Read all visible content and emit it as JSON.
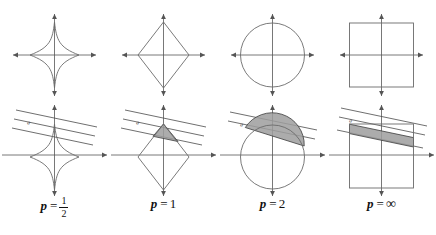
{
  "figure": {
    "rows": 2,
    "columns": 4,
    "colors": {
      "curve": "#6b6b6b",
      "axis": "#555555",
      "line": "#4a4a4a",
      "shade_fill": "#9e9e9e",
      "shade_stroke": "#3c3c3c",
      "text": "#111111",
      "background": "#ffffff"
    }
  },
  "panels": [
    {
      "id": "p-half",
      "p_value": "1/2",
      "shape": "astroid",
      "caption": {
        "variable": "p",
        "equals": "=",
        "numerator": "1",
        "denominator": "2"
      },
      "line_label": "a",
      "has_shading": false,
      "shade_shape": "none"
    },
    {
      "id": "p-one",
      "p_value": "1",
      "shape": "diamond",
      "caption": {
        "variable": "p",
        "equals": "=",
        "value": "1"
      },
      "line_label": "a",
      "has_shading": true,
      "shade_shape": "triangle-cap"
    },
    {
      "id": "p-two",
      "p_value": "2",
      "shape": "circle",
      "caption": {
        "variable": "p",
        "equals": "=",
        "value": "2"
      },
      "line_label": "a",
      "has_shading": true,
      "shade_shape": "circular-segment"
    },
    {
      "id": "p-infinity",
      "p_value": "∞",
      "shape": "square",
      "caption": {
        "variable": "p",
        "equals": "=",
        "value": "∞"
      },
      "line_label": "a",
      "has_shading": true,
      "shade_shape": "parallelogram-band"
    }
  ],
  "axes": {
    "x_axis_name": "horizontal-axis",
    "y_axis_name": "vertical-axis",
    "arrowheads": 4
  },
  "band": {
    "line_count": 3,
    "orientation": "downward-sloping",
    "label": "a"
  }
}
